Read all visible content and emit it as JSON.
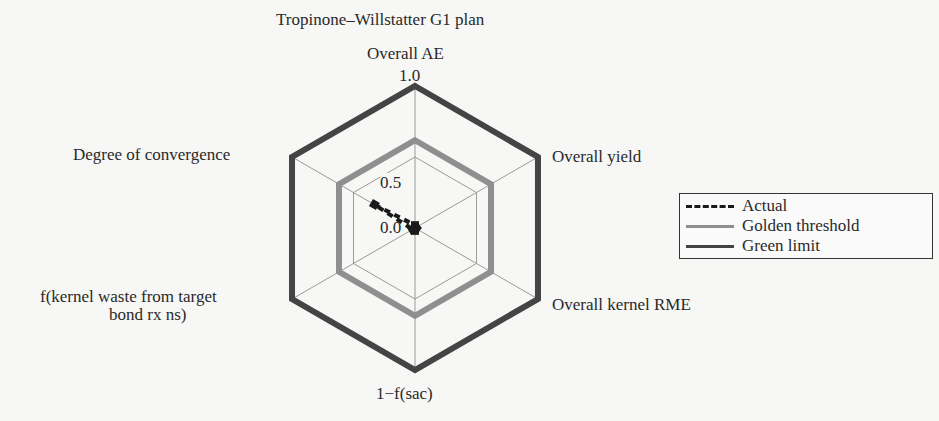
{
  "chart_data": {
    "type": "radar",
    "title": "Tropinone–Willstatter G1 plan",
    "axes": [
      "Overall AE",
      "Overall yield",
      "Overall kernel RME",
      "1−f(sac)",
      "f(kernel waste from target bond rxns)",
      "Degree of convergence"
    ],
    "axis_labels_display": {
      "top": "Overall AE",
      "upper_right": "Overall yield",
      "lower_right": "Overall kernel RME",
      "bottom": "1−f(sac)",
      "lower_left_line1": "f(kernel waste from target",
      "lower_left_line2": "bond rx ns)",
      "upper_left": "Degree of convergence"
    },
    "radial_ticks": [
      "0.0",
      "0.5",
      "1.0"
    ],
    "rlim": [
      0,
      1
    ],
    "grid": true,
    "series": [
      {
        "name": "Actual",
        "style": "dashed",
        "color": "#1a1a1a",
        "values": [
          0.02,
          0.01,
          0.01,
          0.02,
          0.02,
          0.33
        ]
      },
      {
        "name": "Golden threshold",
        "style": "solid",
        "color": "#8f8f8f",
        "values": [
          0.618,
          0.618,
          0.618,
          0.618,
          0.618,
          0.618
        ]
      },
      {
        "name": "Green limit",
        "style": "solid",
        "color": "#444444",
        "values": [
          1.0,
          1.0,
          1.0,
          1.0,
          1.0,
          1.0
        ]
      }
    ],
    "legend_position": "right"
  },
  "legend": {
    "items": [
      {
        "label": "Actual"
      },
      {
        "label": "Golden threshold"
      },
      {
        "label": "Green limit"
      }
    ]
  }
}
